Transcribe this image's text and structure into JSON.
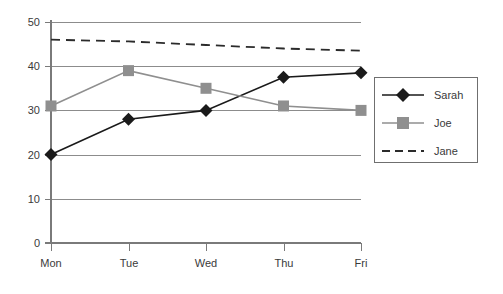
{
  "chart_data": {
    "type": "line",
    "title": "",
    "xlabel": "",
    "ylabel": "",
    "categories": [
      "Mon",
      "Tue",
      "Wed",
      "Thu",
      "Fri"
    ],
    "ylim": [
      0,
      50
    ],
    "yticks": [
      0,
      10,
      20,
      30,
      40,
      50
    ],
    "ytick_labels": [
      "0",
      "10",
      "20",
      "30",
      "40",
      "50"
    ],
    "grid": true,
    "legend_position": "right",
    "series": [
      {
        "name": "Sarah",
        "values": [
          20,
          28,
          30,
          37.5,
          38.5
        ],
        "color": "#1a1a1a",
        "marker": "diamond",
        "linestyle": "solid"
      },
      {
        "name": "Joe",
        "values": [
          31,
          39,
          35,
          31,
          30
        ],
        "color": "#8f8f8f",
        "marker": "square",
        "linestyle": "solid"
      },
      {
        "name": "Jane",
        "values": [
          46,
          45.6,
          44.8,
          44.0,
          43.5
        ],
        "color": "#2b2b2b",
        "marker": "none",
        "linestyle": "dashed"
      }
    ]
  },
  "axes": {
    "y_tick_0": "0",
    "y_tick_1": "10",
    "y_tick_2": "20",
    "y_tick_3": "30",
    "y_tick_4": "40",
    "y_tick_5": "50",
    "x_tick_0": "Mon",
    "x_tick_1": "Tue",
    "x_tick_2": "Wed",
    "x_tick_3": "Thu",
    "x_tick_4": "Fri"
  },
  "legend": {
    "entry_0": "Sarah",
    "entry_1": "Joe",
    "entry_2": "Jane"
  }
}
